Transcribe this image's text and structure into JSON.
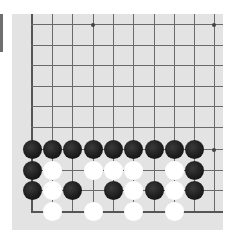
{
  "board": {
    "background": "#e3e3e3",
    "line_color": "#6a6a6a",
    "columns_x": [
      32,
      52,
      72,
      93,
      113,
      133,
      154,
      174,
      194,
      214
    ],
    "rows_y": [
      24,
      45,
      65,
      86,
      106,
      127,
      149,
      170,
      190,
      211
    ],
    "left_edge_col": 0,
    "bottom_edge_row": 9,
    "star_points": [
      {
        "col": 3,
        "row": 0
      },
      {
        "col": 9,
        "row": 0
      },
      {
        "col": 9,
        "row": 6
      }
    ]
  },
  "stones": [
    {
      "color": "black",
      "col": 0,
      "row": 6
    },
    {
      "color": "black",
      "col": 1,
      "row": 6
    },
    {
      "color": "black",
      "col": 2,
      "row": 6
    },
    {
      "color": "black",
      "col": 3,
      "row": 6
    },
    {
      "color": "black",
      "col": 4,
      "row": 6
    },
    {
      "color": "black",
      "col": 5,
      "row": 6
    },
    {
      "color": "black",
      "col": 6,
      "row": 6
    },
    {
      "color": "black",
      "col": 7,
      "row": 6
    },
    {
      "color": "black",
      "col": 8,
      "row": 6
    },
    {
      "color": "black",
      "col": 0,
      "row": 7
    },
    {
      "color": "white",
      "col": 1,
      "row": 7
    },
    {
      "color": "white",
      "col": 3,
      "row": 7
    },
    {
      "color": "white",
      "col": 4,
      "row": 7
    },
    {
      "color": "white",
      "col": 5,
      "row": 7
    },
    {
      "color": "white",
      "col": 7,
      "row": 7
    },
    {
      "color": "black",
      "col": 8,
      "row": 7
    },
    {
      "color": "black",
      "col": 0,
      "row": 8
    },
    {
      "color": "white",
      "col": 1,
      "row": 8
    },
    {
      "color": "black",
      "col": 2,
      "row": 8
    },
    {
      "color": "black",
      "col": 4,
      "row": 8
    },
    {
      "color": "white",
      "col": 5,
      "row": 8
    },
    {
      "color": "black",
      "col": 6,
      "row": 8
    },
    {
      "color": "white",
      "col": 7,
      "row": 8
    },
    {
      "color": "black",
      "col": 8,
      "row": 8
    },
    {
      "color": "white",
      "col": 1,
      "row": 9
    },
    {
      "color": "white",
      "col": 3,
      "row": 9
    },
    {
      "color": "white",
      "col": 5,
      "row": 9
    },
    {
      "color": "white",
      "col": 7,
      "row": 9
    }
  ]
}
